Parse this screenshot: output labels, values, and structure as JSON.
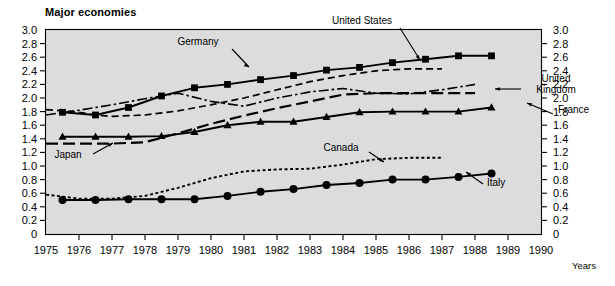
{
  "title": "Major economies",
  "axes": {
    "y_left_ticks": [
      "3.0",
      "2.8",
      "2.6",
      "2.4",
      "2.2",
      "2.0",
      "1.8",
      "1.6",
      "1.4",
      "1.2",
      "1.0",
      "0.8",
      "0.6",
      "0.4",
      "0.2",
      "0"
    ],
    "y_right_ticks": [
      "3.0",
      "2.8",
      "2.6",
      "2.4",
      "2.2",
      "2.0",
      "1.8",
      "1.6",
      "1.4",
      "1.2",
      "1.0",
      "0.8",
      "0.6",
      "0.4",
      "0.2",
      "0"
    ],
    "x_ticks": [
      "1975",
      "1976",
      "1977",
      "1978",
      "1979",
      "1980",
      "1981",
      "1982",
      "1983",
      "1984",
      "1985",
      "1986",
      "1987",
      "1988",
      "1989",
      "1990"
    ],
    "x_axis_caption": "Years"
  },
  "annotations": [
    {
      "name": "germany",
      "text": "Germany",
      "x": 198,
      "y": 45
    },
    {
      "name": "united-states",
      "text": "United States",
      "x": 362,
      "y": 24
    },
    {
      "name": "united-kingdom-line1",
      "text": "United",
      "x": 556,
      "y": 82
    },
    {
      "name": "united-kingdom-line2",
      "text": "Kingdom",
      "x": 556,
      "y": 93
    },
    {
      "name": "france",
      "text": "France",
      "x": 558,
      "y": 113
    },
    {
      "name": "japan",
      "text": "Japan",
      "x": 68,
      "y": 158
    },
    {
      "name": "canada",
      "text": "Canada",
      "x": 341,
      "y": 151
    },
    {
      "name": "italy",
      "text": "Italy",
      "x": 487,
      "y": 186
    }
  ],
  "chart_data": {
    "type": "line",
    "title": "Major economies",
    "xlabel": "Years",
    "ylabel": "",
    "xlim": [
      1975,
      1990
    ],
    "ylim": [
      0,
      3.0
    ],
    "grid": false,
    "legend": "inline-annotations",
    "x": [
      1975,
      1975.5,
      1976,
      1976.5,
      1977,
      1977.5,
      1978,
      1978.5,
      1979,
      1979.5,
      1980,
      1980.5,
      1981,
      1981.5,
      1982,
      1982.5,
      1983,
      1983.5,
      1984,
      1984.5,
      1985,
      1985.5,
      1986,
      1986.5,
      1987,
      1987.5,
      1988,
      1988.5,
      1989
    ],
    "series": [
      {
        "name": "Germany",
        "style": "solid-square",
        "marker": "square",
        "x": [
          1975.5,
          1976.5,
          1977.5,
          1978.5,
          1979.5,
          1980.5,
          1981.5,
          1982.5,
          1983.5,
          1984.5,
          1985.5,
          1986.5,
          1987.5,
          1988.5
        ],
        "values": [
          1.79,
          1.75,
          1.86,
          2.03,
          2.15,
          2.2,
          2.27,
          2.33,
          2.41,
          2.45,
          2.52,
          2.57,
          2.62,
          2.62
        ]
      },
      {
        "name": "United States",
        "style": "short-dash",
        "marker": "none",
        "x": [
          1975,
          1975.5,
          1976,
          1976.5,
          1977,
          1977.5,
          1978,
          1979,
          1980,
          1981,
          1982,
          1983,
          1984,
          1985,
          1986,
          1987
        ],
        "values": [
          1.83,
          1.81,
          1.79,
          1.75,
          1.73,
          1.74,
          1.75,
          1.81,
          1.9,
          2.0,
          2.12,
          2.24,
          2.33,
          2.4,
          2.43,
          2.43
        ]
      },
      {
        "name": "United Kingdom",
        "style": "dash-dot",
        "marker": "none",
        "x": [
          1975,
          1976,
          1977,
          1978,
          1979,
          1980,
          1981,
          1982,
          1983,
          1984,
          1985,
          1986,
          1987,
          1988
        ],
        "values": [
          1.75,
          1.82,
          1.9,
          1.99,
          2.07,
          1.95,
          1.88,
          2.0,
          2.09,
          2.14,
          2.07,
          2.06,
          2.12,
          2.2
        ]
      },
      {
        "name": "Japan",
        "style": "long-dash",
        "marker": "none",
        "x": [
          1975,
          1976,
          1977,
          1978,
          1979,
          1980,
          1981,
          1982,
          1983,
          1984,
          1985,
          1986,
          1987,
          1988
        ],
        "values": [
          1.33,
          1.33,
          1.33,
          1.35,
          1.48,
          1.62,
          1.74,
          1.85,
          1.95,
          2.05,
          2.07,
          2.07,
          2.07,
          2.07
        ]
      },
      {
        "name": "France",
        "style": "solid-triangle",
        "marker": "triangle",
        "x": [
          1975.5,
          1976.5,
          1977.5,
          1978.5,
          1979.5,
          1980.5,
          1981.5,
          1982.5,
          1983.5,
          1984.5,
          1985.5,
          1986.5,
          1987.5,
          1988.5
        ],
        "values": [
          1.43,
          1.43,
          1.43,
          1.44,
          1.5,
          1.6,
          1.65,
          1.65,
          1.72,
          1.79,
          1.8,
          1.8,
          1.8,
          1.86
        ]
      },
      {
        "name": "Canada",
        "style": "dotted",
        "marker": "none",
        "x": [
          1975,
          1976,
          1977,
          1978,
          1979,
          1980,
          1981,
          1982,
          1983,
          1984,
          1985,
          1986,
          1987
        ],
        "values": [
          0.58,
          0.52,
          0.52,
          0.56,
          0.68,
          0.82,
          0.92,
          0.95,
          0.96,
          1.02,
          1.1,
          1.12,
          1.12
        ]
      },
      {
        "name": "Italy",
        "style": "solid-circle",
        "marker": "circle",
        "x": [
          1975.5,
          1976.5,
          1977.5,
          1978.5,
          1979.5,
          1980.5,
          1981.5,
          1982.5,
          1983.5,
          1984.5,
          1985.5,
          1986.5,
          1987.5,
          1988.5
        ],
        "values": [
          0.5,
          0.5,
          0.51,
          0.51,
          0.51,
          0.56,
          0.62,
          0.66,
          0.72,
          0.75,
          0.8,
          0.8,
          0.84,
          0.89
        ]
      }
    ]
  },
  "colors": {
    "plot_background": "#dcdcdc",
    "page_background": "#ffffff",
    "line": "#000000",
    "text": "#000000"
  }
}
